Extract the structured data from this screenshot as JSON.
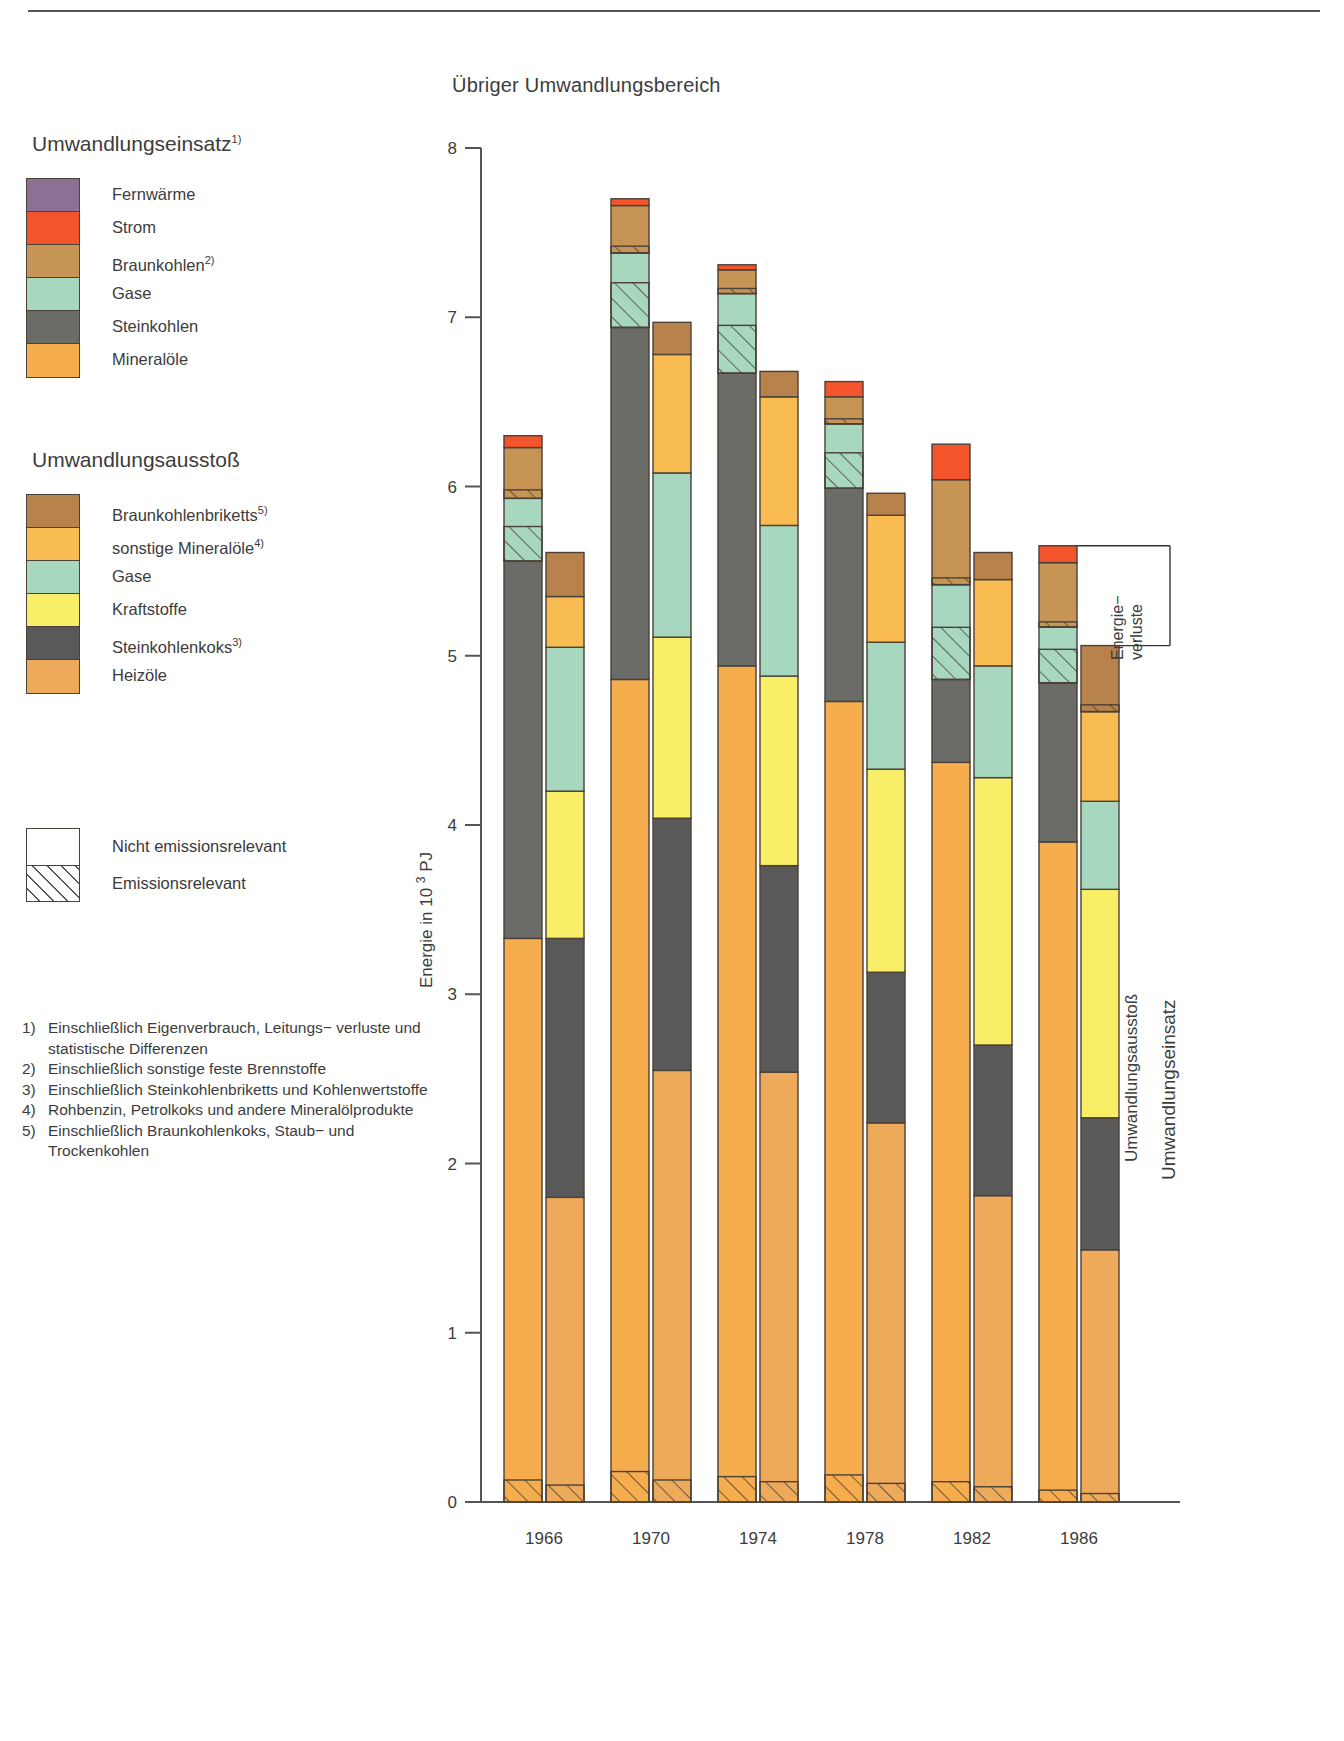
{
  "chart_title": "Übriger Umwandlungsbereich",
  "legends": [
    {
      "heading": "Umwandlungseinsatz",
      "heading_sup": "1)",
      "items": [
        {
          "label": "Fernwärme",
          "sup": "",
          "color": "#8d7195"
        },
        {
          "label": "Strom",
          "sup": "",
          "color": "#f4542c"
        },
        {
          "label": "Braunkohlen",
          "sup": "2)",
          "color": "#c69455"
        },
        {
          "label": "Gase",
          "sup": "",
          "color": "#a8d7bf"
        },
        {
          "label": "Steinkohlen",
          "sup": "",
          "color": "#6b6b68"
        },
        {
          "label": "Mineralöle",
          "sup": "",
          "color": "#f5ad4e"
        }
      ]
    },
    {
      "heading": "Umwandlungsausstoß",
      "heading_sup": "",
      "items": [
        {
          "label": "Braunkohlenbriketts",
          "sup": "5)",
          "color": "#b8824c"
        },
        {
          "label": "sonstige Mineralöle",
          "sup": "4)",
          "color": "#f9bc52"
        },
        {
          "label": "Gase",
          "sup": "",
          "color": "#a8d7bf"
        },
        {
          "label": "Kraftstoffe",
          "sup": "",
          "color": "#f9ee67"
        },
        {
          "label": "Steinkohlenkoks",
          "sup": "3)",
          "color": "#59595a"
        },
        {
          "label": "Heizöle",
          "sup": "",
          "color": "#edaa5b"
        }
      ]
    }
  ],
  "pattern_legend": [
    {
      "label": "Nicht emissionsrelevant",
      "pattern": "solid"
    },
    {
      "label": "Emissionsrelevant",
      "pattern": "hatched"
    }
  ],
  "footnotes": [
    {
      "num": "1)",
      "text": "Einschließlich Eigenverbrauch, Leitungs− verluste und statistische Differenzen"
    },
    {
      "num": "2)",
      "text": "Einschließlich sonstige feste Brennstoffe"
    },
    {
      "num": "3)",
      "text": "Einschließlich Steinkohlenbriketts und Kohlenwertstoffe"
    },
    {
      "num": "4)",
      "text": "Rohbenzin, Petrolkoks und andere Mineralölprodukte"
    },
    {
      "num": "5)",
      "text": "Einschließlich Braunkohlenkoks, Staub− und Trockenkohlen"
    }
  ],
  "side_labels": {
    "energieverluste": "Energie−\nverluste",
    "energieverluste_line1": "Energie−",
    "energieverluste_line2": "verluste",
    "ausstoss": "Umwandlungsausstoß",
    "einsatz": "Umwandlungseinsatz"
  },
  "chart_data": {
    "type": "bar",
    "title": "Übriger Umwandlungsbereich",
    "xlabel": "",
    "ylabel": "Energie in 10 ³  PJ",
    "ylabel_parts": {
      "pre": "Energie in 10",
      "sup": "3",
      "post": "PJ"
    },
    "ylim": [
      0,
      8
    ],
    "yticks": [
      0,
      1,
      2,
      3,
      4,
      5,
      6,
      7,
      8
    ],
    "grid": false,
    "legend_position": "left",
    "categories": [
      "1966",
      "1970",
      "1974",
      "1978",
      "1982",
      "1986"
    ],
    "group_totals": {
      "Umwandlungseinsatz": [
        6.26,
        7.7,
        7.31,
        6.62,
        6.25,
        5.65
      ],
      "Umwandlungsausstoß": [
        5.61,
        6.97,
        6.68,
        5.96,
        5.61,
        5.06
      ]
    },
    "series": [
      {
        "group": "Umwandlungseinsatz",
        "name": "Mineralöle",
        "color": "#f5ad4e",
        "values": [
          3.33,
          4.86,
          4.94,
          4.73,
          4.37,
          3.9
        ],
        "emission_relevant_base": [
          0.13,
          0.18,
          0.15,
          0.16,
          0.12,
          0.07
        ]
      },
      {
        "group": "Umwandlungseinsatz",
        "name": "Steinkohlen",
        "color": "#6b6b68",
        "values": [
          2.23,
          2.08,
          1.73,
          1.26,
          0.49,
          0.94
        ]
      },
      {
        "group": "Umwandlungseinsatz",
        "name": "Gase",
        "color": "#a8d7bf",
        "values": [
          0.37,
          0.44,
          0.47,
          0.38,
          0.56,
          0.33
        ],
        "emission_relevant_share": [
          0.55,
          0.6,
          0.6,
          0.55,
          0.55,
          0.6
        ]
      },
      {
        "group": "Umwandlungseinsatz",
        "name": "Braunkohlen",
        "color": "#c69455",
        "values": [
          0.3,
          0.28,
          0.14,
          0.16,
          0.62,
          0.38
        ],
        "emission_relevant_base": [
          0.05,
          0.04,
          0.03,
          0.03,
          0.04,
          0.03
        ]
      },
      {
        "group": "Umwandlungseinsatz",
        "name": "Strom",
        "color": "#f4542c",
        "values": [
          0.07,
          0.04,
          0.03,
          0.09,
          0.21,
          0.1
        ]
      },
      {
        "group": "Umwandlungseinsatz",
        "name": "Fernwärme",
        "color": "#8d7195",
        "values": [
          0.0,
          0.0,
          0.0,
          0.0,
          0.0,
          0.0
        ]
      },
      {
        "group": "Umwandlungsausstoß",
        "name": "Heizöle",
        "color": "#edaa5b",
        "values": [
          1.8,
          2.55,
          2.54,
          2.24,
          1.81,
          1.49
        ],
        "emission_relevant_base": [
          0.1,
          0.13,
          0.12,
          0.11,
          0.09,
          0.05
        ]
      },
      {
        "group": "Umwandlungsausstoß",
        "name": "Steinkohlenkoks",
        "color": "#59595a",
        "values": [
          1.53,
          1.49,
          1.22,
          0.89,
          0.89,
          0.78
        ]
      },
      {
        "group": "Umwandlungsausstoß",
        "name": "Kraftstoffe",
        "color": "#f9ee67",
        "values": [
          0.87,
          1.07,
          1.12,
          1.2,
          1.58,
          1.35
        ]
      },
      {
        "group": "Umwandlungsausstoß",
        "name": "Gase",
        "color": "#a8d7bf",
        "values": [
          0.85,
          0.97,
          0.89,
          0.75,
          0.66,
          0.52
        ]
      },
      {
        "group": "Umwandlungsausstoß",
        "name": "sonstige Mineralöle",
        "color": "#f9bc52",
        "values": [
          0.3,
          0.7,
          0.76,
          0.75,
          0.51,
          0.53
        ]
      },
      {
        "group": "Umwandlungsausstoß",
        "name": "Braunkohlenbriketts",
        "color": "#b8824c",
        "values": [
          0.26,
          0.19,
          0.15,
          0.13,
          0.16,
          0.39
        ],
        "emission_relevant_base": [
          0.0,
          0.0,
          0.0,
          0.0,
          0.0,
          0.04
        ]
      }
    ]
  }
}
